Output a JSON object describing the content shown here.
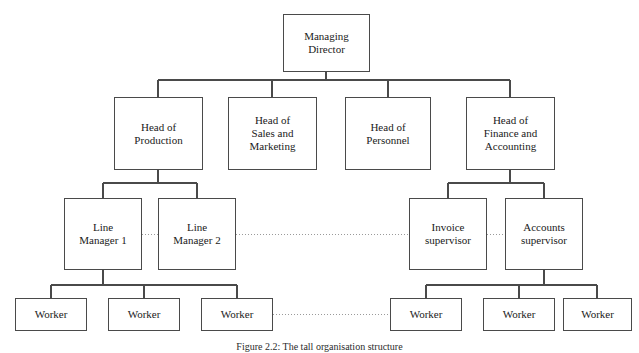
{
  "figure": {
    "caption": "Figure 2.2: The tall organisation structure",
    "caption_top": 341,
    "width": 639,
    "height": 353,
    "line_color": "#4a4a4a",
    "dotted_color": "#9a9a9a",
    "background": "#ffffff"
  },
  "chart_data": {
    "type": "diagram",
    "title": "Figure 2.2: The tall organisation structure",
    "diagram_kind": "organisation-chart",
    "levels": [
      [
        "Managing Director"
      ],
      [
        "Head of Production",
        "Head of Sales and Marketing",
        "Head of Personnel",
        "Head of Finance and Accounting"
      ],
      [
        "Line Manager 1",
        "Line Manager 2",
        "Invoice supervisor",
        "Accounts supervisor"
      ],
      [
        "Worker",
        "Worker",
        "Worker",
        "Worker",
        "Worker",
        "Worker"
      ]
    ],
    "hierarchy_edges": [
      [
        "Managing Director",
        "Head of Production"
      ],
      [
        "Managing Director",
        "Head of Sales and Marketing"
      ],
      [
        "Managing Director",
        "Head of Personnel"
      ],
      [
        "Managing Director",
        "Head of Finance and Accounting"
      ],
      [
        "Head of Production",
        "Line Manager 1"
      ],
      [
        "Head of Production",
        "Line Manager 2"
      ],
      [
        "Head of Finance and Accounting",
        "Invoice supervisor"
      ],
      [
        "Head of Finance and Accounting",
        "Accounts supervisor"
      ],
      [
        "Line Manager 1",
        "Worker 1"
      ],
      [
        "Line Manager 1",
        "Worker 2"
      ],
      [
        "Line Manager 1",
        "Worker 3"
      ],
      [
        "Accounts supervisor",
        "Worker 4"
      ],
      [
        "Accounts supervisor",
        "Worker 5"
      ],
      [
        "Accounts supervisor",
        "Worker 6"
      ]
    ],
    "dotted_edges": [
      [
        "Line Manager 1",
        "Line Manager 2"
      ],
      [
        "Line Manager 2",
        "Invoice supervisor"
      ],
      [
        "Invoice supervisor",
        "Accounts supervisor"
      ],
      [
        "Worker 3",
        "Worker 4"
      ]
    ]
  },
  "nodes": [
    {
      "id": "managing-director",
      "label": "Managing\nDirector",
      "x": 283,
      "y": 14,
      "w": 87,
      "h": 58,
      "font": 11
    },
    {
      "id": "head-of-production",
      "label": "Head of\nProduction",
      "x": 114,
      "y": 97,
      "w": 89,
      "h": 73,
      "font": 11
    },
    {
      "id": "head-of-sales-and-marketing",
      "label": "Head of\nSales and\nMarketing",
      "x": 228,
      "y": 97,
      "w": 89,
      "h": 73,
      "font": 11
    },
    {
      "id": "head-of-personnel",
      "label": "Head of\nPersonnel",
      "x": 345,
      "y": 97,
      "w": 86,
      "h": 73,
      "font": 11
    },
    {
      "id": "head-of-finance-and-accounting",
      "label": "Head of\nFinance and\nAccounting",
      "x": 466,
      "y": 97,
      "w": 89,
      "h": 73,
      "font": 11
    },
    {
      "id": "line-manager-1",
      "label": "Line\nManager 1",
      "x": 64,
      "y": 198,
      "w": 78,
      "h": 72,
      "font": 11
    },
    {
      "id": "line-manager-2",
      "label": "Line\nManager 2",
      "x": 158,
      "y": 198,
      "w": 78,
      "h": 72,
      "font": 11
    },
    {
      "id": "invoice-supervisor",
      "label": "Invoice\nsupervisor",
      "x": 409,
      "y": 198,
      "w": 78,
      "h": 72,
      "font": 11
    },
    {
      "id": "accounts-supervisor",
      "label": "Accounts\nsupervisor",
      "x": 505,
      "y": 198,
      "w": 78,
      "h": 72,
      "font": 11
    },
    {
      "id": "worker-1",
      "label": "Worker",
      "x": 15,
      "y": 298,
      "w": 72,
      "h": 33,
      "font": 11
    },
    {
      "id": "worker-2",
      "label": "Worker",
      "x": 108,
      "y": 298,
      "w": 72,
      "h": 33,
      "font": 11
    },
    {
      "id": "worker-3",
      "label": "Worker",
      "x": 201,
      "y": 298,
      "w": 72,
      "h": 33,
      "font": 11
    },
    {
      "id": "worker-4",
      "label": "Worker",
      "x": 390,
      "y": 298,
      "w": 72,
      "h": 33,
      "font": 11
    },
    {
      "id": "worker-5",
      "label": "Worker",
      "x": 483,
      "y": 298,
      "w": 72,
      "h": 33,
      "font": 11
    },
    {
      "id": "worker-6",
      "label": "Worker",
      "x": 563,
      "y": 298,
      "w": 69,
      "h": 33,
      "font": 11
    }
  ],
  "solid_connectors": [
    {
      "id": "md-drop",
      "x1": 326,
      "y1": 72,
      "x2": 326,
      "y2": 80
    },
    {
      "id": "level1-bus",
      "x1": 158,
      "y1": 80,
      "x2": 510,
      "y2": 80
    },
    {
      "id": "hp-drop",
      "x1": 158,
      "y1": 80,
      "x2": 158,
      "y2": 97
    },
    {
      "id": "hsm-drop",
      "x1": 272,
      "y1": 80,
      "x2": 272,
      "y2": 97
    },
    {
      "id": "hper-drop",
      "x1": 388,
      "y1": 80,
      "x2": 388,
      "y2": 97
    },
    {
      "id": "hfa-drop",
      "x1": 510,
      "y1": 80,
      "x2": 510,
      "y2": 97
    },
    {
      "id": "hp-down",
      "x1": 158,
      "y1": 170,
      "x2": 158,
      "y2": 183
    },
    {
      "id": "prod-bus",
      "x1": 103,
      "y1": 183,
      "x2": 197,
      "y2": 183
    },
    {
      "id": "lm1-drop",
      "x1": 103,
      "y1": 183,
      "x2": 103,
      "y2": 198
    },
    {
      "id": "lm2-drop",
      "x1": 197,
      "y1": 183,
      "x2": 197,
      "y2": 198
    },
    {
      "id": "hfa-down",
      "x1": 510,
      "y1": 170,
      "x2": 510,
      "y2": 183
    },
    {
      "id": "fin-bus",
      "x1": 448,
      "y1": 183,
      "x2": 544,
      "y2": 183
    },
    {
      "id": "inv-drop",
      "x1": 448,
      "y1": 183,
      "x2": 448,
      "y2": 198
    },
    {
      "id": "acc-drop",
      "x1": 544,
      "y1": 183,
      "x2": 544,
      "y2": 198
    },
    {
      "id": "lm1-down",
      "x1": 103,
      "y1": 270,
      "x2": 103,
      "y2": 285
    },
    {
      "id": "worker-bus-left",
      "x1": 51,
      "y1": 285,
      "x2": 237,
      "y2": 285
    },
    {
      "id": "w1-drop",
      "x1": 51,
      "y1": 285,
      "x2": 51,
      "y2": 298
    },
    {
      "id": "w2-drop",
      "x1": 144,
      "y1": 285,
      "x2": 144,
      "y2": 298
    },
    {
      "id": "w3-drop",
      "x1": 237,
      "y1": 285,
      "x2": 237,
      "y2": 298
    },
    {
      "id": "acc-down",
      "x1": 544,
      "y1": 270,
      "x2": 544,
      "y2": 285
    },
    {
      "id": "worker-bus-right",
      "x1": 426,
      "y1": 285,
      "x2": 597,
      "y2": 285
    },
    {
      "id": "w4-drop",
      "x1": 426,
      "y1": 285,
      "x2": 426,
      "y2": 298
    },
    {
      "id": "w5-drop",
      "x1": 519,
      "y1": 285,
      "x2": 519,
      "y2": 298
    },
    {
      "id": "w6-drop",
      "x1": 597,
      "y1": 285,
      "x2": 597,
      "y2": 298
    }
  ],
  "dotted_connectors": [
    {
      "id": "lm1-to-lm2",
      "x1": 142,
      "y1": 234,
      "x2": 158,
      "y2": 234
    },
    {
      "id": "lm2-to-inv",
      "x1": 236,
      "y1": 234,
      "x2": 409,
      "y2": 234
    },
    {
      "id": "inv-to-acc",
      "x1": 487,
      "y1": 234,
      "x2": 505,
      "y2": 234
    },
    {
      "id": "w3-to-w4",
      "x1": 273,
      "y1": 314,
      "x2": 390,
      "y2": 314
    }
  ]
}
